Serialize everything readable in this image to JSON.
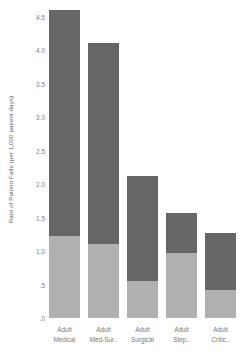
{
  "chart_data": {
    "type": "bar",
    "subtype": "stacked",
    "title": "",
    "xlabel": "",
    "ylabel": "Rate of Patient Falls (per 1,000 patient days)",
    "categories": [
      "Adult Medical",
      "Adult Med-Sur..",
      "Adult Surgical",
      "Adult Step..",
      "Adult Critic.."
    ],
    "category_lines": [
      [
        "Adult",
        "Medical"
      ],
      [
        "Adult",
        "Med-Sur.."
      ],
      [
        "Adult",
        "Surgical"
      ],
      [
        "Adult",
        "Step.."
      ],
      [
        "Adult",
        "Critic.."
      ]
    ],
    "series": [
      {
        "name": "lower-segment",
        "color": "#b0b0b0",
        "values": [
          1.22,
          1.1,
          0.55,
          0.97,
          0.42
        ]
      },
      {
        "name": "upper-segment",
        "color": "#666666",
        "values": [
          3.38,
          3.01,
          1.57,
          0.6,
          0.85
        ]
      }
    ],
    "totals": [
      4.6,
      4.11,
      2.12,
      1.57,
      1.27
    ],
    "ylim": [
      0,
      4.75
    ],
    "yticks": [
      0,
      0.5,
      1.0,
      1.5,
      2.0,
      2.5,
      3.0,
      3.5,
      4.0,
      4.5
    ],
    "ytick_labels": [
      ".0",
      ".5",
      "1.0",
      "1.5",
      "2.0",
      "2.5",
      "3.0",
      "3.5",
      "4.0",
      "4.5"
    ],
    "grid": false,
    "legend": "none"
  },
  "colors": {
    "dark_segment": "#666666",
    "light_segment": "#b0b0b0",
    "background": "#ffffff",
    "text": "#737373"
  }
}
